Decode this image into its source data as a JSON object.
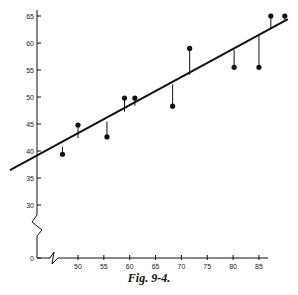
{
  "caption": "Fig. 9-4.",
  "chart_data": {
    "type": "scatter",
    "title": "",
    "xlabel": "",
    "ylabel": "",
    "x_ticks": [
      50,
      55,
      60,
      65,
      70,
      75,
      80,
      85
    ],
    "y_ticks": [
      0,
      30,
      35,
      40,
      45,
      50,
      55,
      60,
      65
    ],
    "xlim": [
      40,
      92
    ],
    "ylim": [
      28,
      66
    ],
    "axis_breaks": {
      "x": true,
      "y": true
    },
    "grid": false,
    "legend": null,
    "points": [
      {
        "x": 47,
        "y": 39.4
      },
      {
        "x": 50,
        "y": 44.8
      },
      {
        "x": 55.6,
        "y": 42.6
      },
      {
        "x": 59,
        "y": 49.8
      },
      {
        "x": 61,
        "y": 49.8
      },
      {
        "x": 68.3,
        "y": 48.3
      },
      {
        "x": 71.6,
        "y": 59
      },
      {
        "x": 80.2,
        "y": 55.5
      },
      {
        "x": 85,
        "y": 55.5
      },
      {
        "x": 87.3,
        "y": 65
      },
      {
        "x": 90,
        "y": 65
      }
    ],
    "regression_line": {
      "x": [
        40,
        90.6
      ],
      "y": [
        37,
        64.4
      ]
    },
    "residual_lines": true
  },
  "colors": {
    "ink": "#111111",
    "background": "#ffffff"
  }
}
